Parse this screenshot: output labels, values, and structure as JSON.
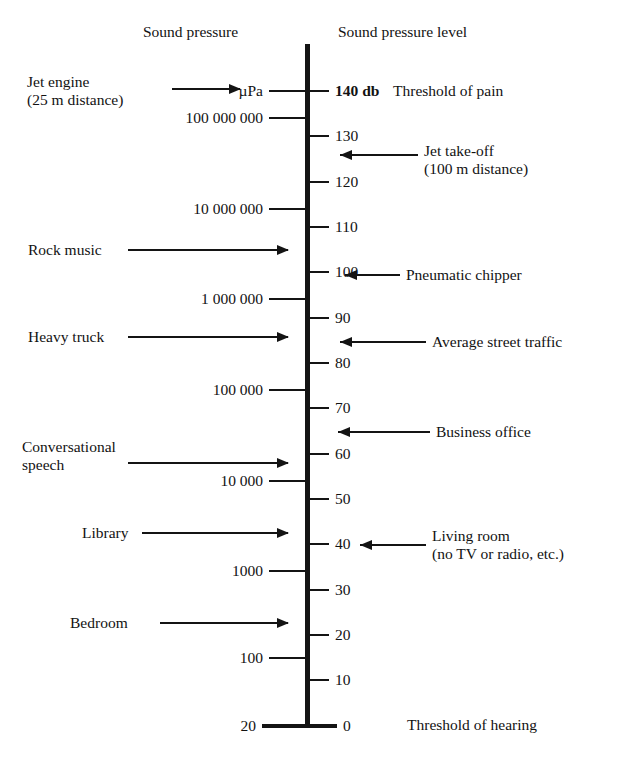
{
  "chart_data": {
    "type": "table",
    "headers": {
      "left": "Sound pressure",
      "right": "Sound pressure level"
    },
    "axis": {
      "db_min": 0,
      "db_max": 140,
      "unit_label": "µPa",
      "db_suffix": "db"
    },
    "db_ticks": [
      {
        "value": 140,
        "label": "140 db",
        "bold": true
      },
      {
        "value": 130,
        "label": "130",
        "bold": false
      },
      {
        "value": 120,
        "label": "120",
        "bold": false
      },
      {
        "value": 110,
        "label": "110",
        "bold": false
      },
      {
        "value": 100,
        "label": "100",
        "bold": false
      },
      {
        "value": 90,
        "label": "90",
        "bold": false
      },
      {
        "value": 80,
        "label": "80",
        "bold": false
      },
      {
        "value": 70,
        "label": "70",
        "bold": false
      },
      {
        "value": 60,
        "label": "60",
        "bold": false
      },
      {
        "value": 50,
        "label": "50",
        "bold": false
      },
      {
        "value": 40,
        "label": "40",
        "bold": false
      },
      {
        "value": 30,
        "label": "30",
        "bold": false
      },
      {
        "value": 20,
        "label": "20",
        "bold": false
      },
      {
        "value": 10,
        "label": "10",
        "bold": false
      },
      {
        "value": 0,
        "label": "0",
        "bold": false
      }
    ],
    "pressure_ticks": [
      {
        "db": 140,
        "label": "µPa"
      },
      {
        "db": 134,
        "label": "100 000 000"
      },
      {
        "db": 114,
        "label": "10 000 000"
      },
      {
        "db": 94,
        "label": "1 000 000"
      },
      {
        "db": 74,
        "label": "100 000"
      },
      {
        "db": 54,
        "label": "10 000"
      },
      {
        "db": 34,
        "label": "1000"
      },
      {
        "db": 15,
        "label": "100"
      },
      {
        "db": 0,
        "label": "20"
      }
    ],
    "left_annotations": [
      {
        "db": 140,
        "lines": [
          "Jet engine",
          "(25 m distance)"
        ]
      },
      {
        "db": 110,
        "lines": [
          "Rock music"
        ]
      },
      {
        "db": 91,
        "lines": [
          "Heavy truck"
        ]
      },
      {
        "db": 60,
        "lines": [
          "Conversational",
          "speech"
        ]
      },
      {
        "db": 42,
        "lines": [
          "Library"
        ]
      },
      {
        "db": 22,
        "lines": [
          "Bedroom"
        ]
      }
    ],
    "right_annotations": [
      {
        "db": 140,
        "lines": [
          "Threshold of pain"
        ],
        "arrow": false
      },
      {
        "db": 126,
        "lines": [
          "Jet take-off",
          "(100 m distance)"
        ],
        "arrow": true
      },
      {
        "db": 100,
        "lines": [
          "Pneumatic chipper"
        ],
        "arrow": true
      },
      {
        "db": 85,
        "lines": [
          "Average street traffic"
        ],
        "arrow": true
      },
      {
        "db": 65,
        "lines": [
          "Business office"
        ],
        "arrow": true
      },
      {
        "db": 40,
        "lines": [
          "Living room",
          "(no TV or radio, etc.)"
        ],
        "arrow": true
      },
      {
        "db": 0,
        "lines": [
          "Threshold of hearing"
        ],
        "arrow": false
      }
    ],
    "colors": {
      "ink": "#141414",
      "background": "#ffffff"
    }
  }
}
